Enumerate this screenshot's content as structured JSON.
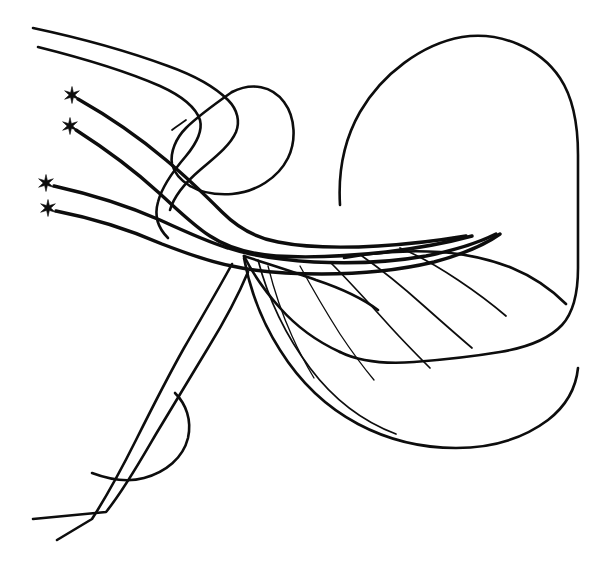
{
  "figure": {
    "type": "line-drawing",
    "background_color": "#ffffff",
    "ink_color": "#0d0d0d",
    "canvas": {
      "width": 610,
      "height": 571
    },
    "marker_label": "star",
    "marker_count": 4,
    "marker_meaning": "asterisk marker at free proximal fiber ending"
  },
  "markers": [
    {
      "name": "star-1",
      "x": 72,
      "y": 95,
      "points": 6,
      "outer_radius": 8.5,
      "inner_radius": 2.8
    },
    {
      "name": "star-2",
      "x": 70,
      "y": 126,
      "points": 6,
      "outer_radius": 8.5,
      "inner_radius": 2.8
    },
    {
      "name": "star-3",
      "x": 46,
      "y": 183,
      "points": 6,
      "outer_radius": 8.5,
      "inner_radius": 2.8
    },
    {
      "name": "star-4",
      "x": 48,
      "y": 208,
      "points": 6,
      "outer_radius": 8.5,
      "inner_radius": 2.8
    }
  ],
  "paths": {
    "blob_outline": "M 340 205 C 338 172 344 140 360 112 C 382 74 422 44 462 37 C 500 31 540 48 560 78 C 574 99 578 126 578 155 L 578 268 C 578 292 574 312 562 325 C 548 340 524 348 500 352 C 470 357 440 360 414 362 C 386 364 360 362 340 352",
    "blob_lower_left": "M 340 352 C 318 342 296 326 280 308 C 264 290 252 272 244 256",
    "oval_outline": "M 232 92 C 252 82 272 86 284 102 C 296 118 296 142 288 158 C 278 178 256 192 232 194 C 216 195 200 192 190 186",
    "oval_inner_left": "M 190 186 C 180 180 174 172 172 164 C 170 152 176 138 186 128 C 196 118 212 106 232 92",
    "oval_tail_hook": "M 172 130 C 177 126 182 123 186 120",
    "ridge_top_1": "M 33 28 C 80 38 130 52 168 66 C 196 76 216 88 228 100 C 238 110 240 122 236 132 C 230 146 214 158 200 170 C 186 182 174 196 170 210",
    "ridge_top_2": "M 38 47 C 82 58 128 72 160 86 C 182 96 196 108 200 120 C 203 132 196 144 186 156 C 174 170 162 186 158 202 C 154 216 158 228 168 238",
    "fiber_1": "M 78 99 C 108 116 140 138 166 160 C 190 180 208 198 222 212 C 238 228 256 238 278 242 C 308 248 344 248 378 246 C 412 244 442 240 466 236",
    "fiber_2": "M 76 130 C 104 148 134 170 158 192 C 178 210 194 226 210 236 C 228 248 250 254 276 256 C 310 258 350 256 386 252 C 420 248 450 242 472 236",
    "fiber_3": "M 54 186 C 90 194 128 206 160 220 C 186 232 208 242 228 248 C 252 256 282 260 314 262 C 352 264 392 262 426 256 C 456 250 480 242 496 234",
    "fiber_4": "M 56 211 C 92 218 130 230 162 244 C 188 254 210 262 232 266 C 258 272 290 274 322 274 C 360 274 400 270 434 262 C 464 254 486 244 500 234",
    "trunk_upper_right": "M 244 256 C 268 264 294 272 316 280 C 340 288 362 298 378 310",
    "trunk_outer": "M 232 264 C 218 290 200 320 184 348 C 166 380 150 412 136 440 C 124 464 108 494 92 519 L 57 540",
    "trunk_inner": "M 248 272 C 238 296 224 322 208 348 C 190 378 172 408 156 434 C 142 458 124 490 106 512 L 33 519",
    "lens_shape": "M 175 393 C 186 404 192 420 188 438 C 183 458 166 472 144 478 C 126 483 108 479 92 473",
    "fan_top_vein": "M 344 258 C 376 252 410 250 440 252 C 468 254 492 260 512 268 C 534 277 552 290 566 304",
    "fan_vein_a": "M 400 248 C 420 256 440 268 458 280 C 476 292 492 304 506 316",
    "fan_vein_b": "M 362 256 C 382 270 404 288 424 306 C 442 322 458 336 472 348",
    "fan_vein_c": "M 330 262 C 348 280 368 302 386 322 C 402 340 418 356 430 368",
    "fan_vein_d": "M 300 266 C 312 288 326 312 340 334 C 352 352 364 368 374 380",
    "fan_vein_e": "M 268 266 C 274 290 282 314 292 336 C 300 354 308 368 314 378",
    "fan_edge_lower": "M 244 258 C 250 290 262 322 280 350 C 300 382 328 408 358 424 C 390 441 424 448 456 448 C 492 448 524 438 548 420 C 566 406 576 388 578 368",
    "fan_inner_contour": "M 258 260 C 268 298 286 336 310 368 C 334 400 364 422 396 434"
  },
  "strokes": {
    "thick": "3.4",
    "medium": "2.6",
    "thin": "1.7",
    "hairline": "1.3"
  }
}
